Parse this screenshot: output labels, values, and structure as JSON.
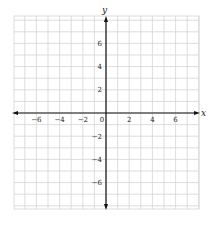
{
  "chart_data": {
    "type": "scatter",
    "title": "",
    "xlabel": "x",
    "ylabel": "y",
    "xlim": [
      -8,
      8
    ],
    "ylim": [
      -8,
      8
    ],
    "grid": true,
    "grid_step": 1,
    "x_ticks": [
      -6,
      -4,
      -2,
      0,
      2,
      4,
      6
    ],
    "x_tick_labels": [
      "−6",
      "−4",
      "−2",
      "0",
      "2",
      "4",
      "6"
    ],
    "y_ticks": [
      6,
      4,
      2,
      -2,
      -4,
      -6
    ],
    "y_tick_labels": [
      "6",
      "4",
      "2",
      "−2",
      "−4",
      "−6"
    ],
    "series": [],
    "colors": {
      "grid": "#d4d4d4",
      "axis": "#111111",
      "text": "#222222"
    }
  }
}
